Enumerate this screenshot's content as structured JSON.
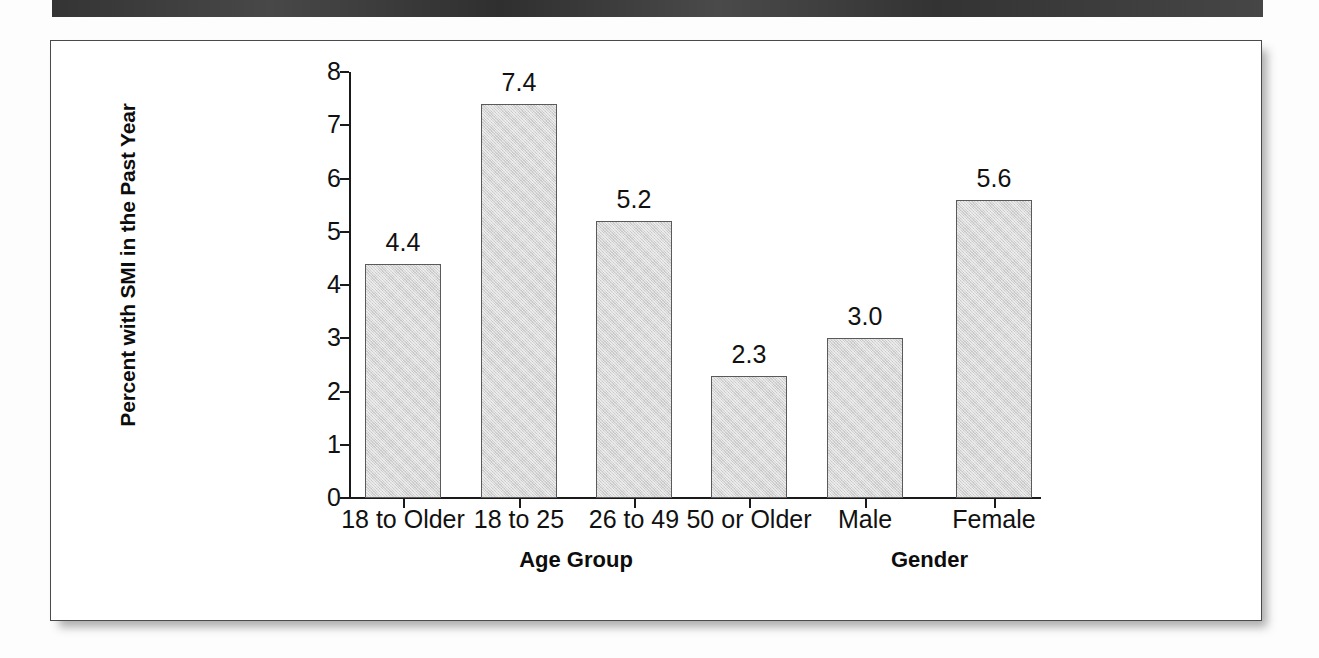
{
  "page": {
    "header_bar": "",
    "bleed_through_text": ""
  },
  "chart_data": {
    "type": "bar",
    "title": "",
    "xlabel": "",
    "ylabel": "Percent with SMI in the Past Year",
    "ylim": [
      0,
      8
    ],
    "ytick_labels": [
      "0",
      "1",
      "2",
      "3",
      "4",
      "5",
      "6",
      "7",
      "8"
    ],
    "ytick_values": [
      0,
      1,
      2,
      3,
      4,
      5,
      6,
      7,
      8
    ],
    "grid": false,
    "legend": "none",
    "categories": [
      "18 to Older",
      "18 to 25",
      "26 to 49",
      "50 or Older",
      "Male",
      "Female"
    ],
    "values": [
      4.4,
      7.4,
      5.2,
      2.3,
      3.0,
      5.6
    ],
    "value_labels": [
      "4.4",
      "7.4",
      "5.2",
      "2.3",
      "3.0",
      "5.6"
    ],
    "group_labels": [
      "Age Group",
      "Gender"
    ],
    "bar_fill_color": "#d6d6d6",
    "bar_border_color": "#5a5a5a",
    "axis_color": "#1a1a1a",
    "text_color": "#111111"
  }
}
